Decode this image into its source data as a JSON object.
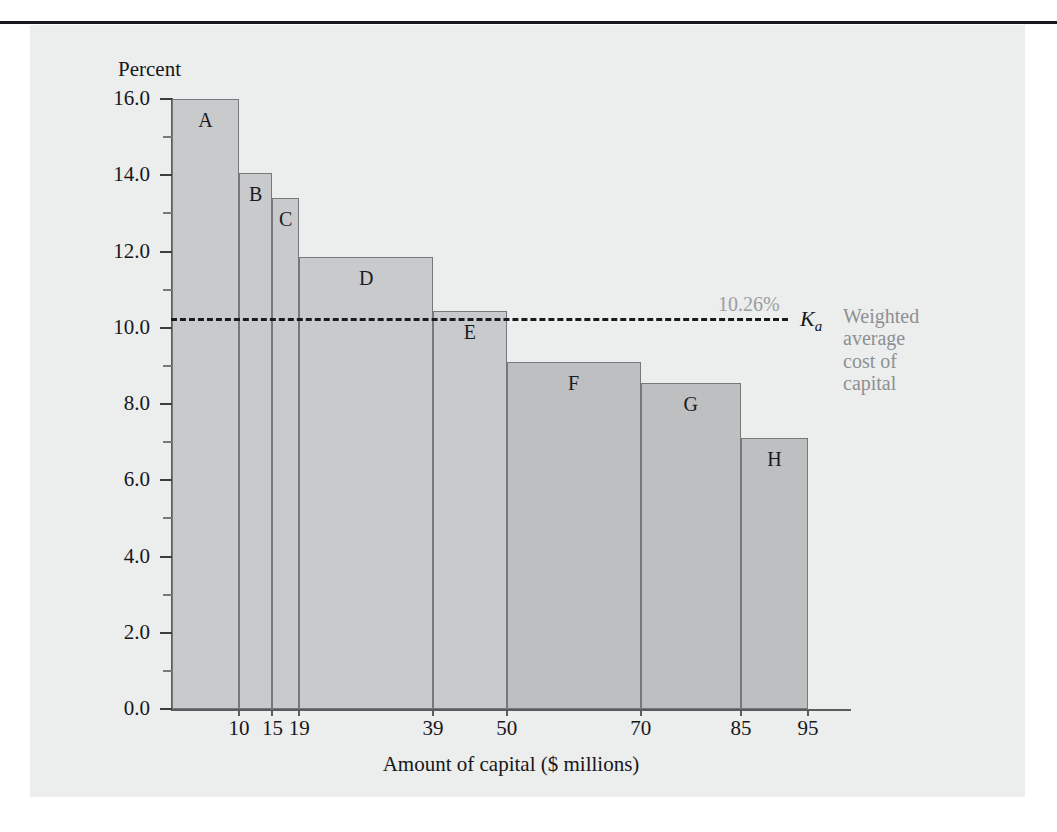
{
  "figure": {
    "y_axis_title": "Percent",
    "x_axis_title": "Amount of capital ($ millions)"
  },
  "annotation": {
    "wacc_value": "10.26%",
    "wacc_symbol": "K",
    "wacc_symbol_sub": "a",
    "caption_line1": "Weighted",
    "caption_line2": "average",
    "caption_line3": "cost of",
    "caption_line4": "capital"
  },
  "colors": {
    "panel_background": "#eceded",
    "bar_light": "#c9cacb",
    "bar_dark": "#bdbfc0",
    "bar_border": "#76797c",
    "text": "#16171a",
    "muted_text": "#8d9094",
    "top_rule": "#16171a"
  },
  "chart_data": {
    "type": "bar",
    "title": "",
    "xlabel": "Amount of capital ($ millions)",
    "ylabel": "Percent",
    "ylim": [
      0.0,
      16.0
    ],
    "xlim": [
      0,
      110
    ],
    "grid": false,
    "legend": "none",
    "y_ticks": [
      "0.0",
      "2.0",
      "4.0",
      "6.0",
      "8.0",
      "10.0",
      "12.0",
      "14.0",
      "16.0"
    ],
    "y_tick_values": [
      0.0,
      2.0,
      4.0,
      6.0,
      8.0,
      10.0,
      12.0,
      14.0,
      16.0
    ],
    "y_minor_tick_values": [
      1.0,
      3.0,
      5.0,
      7.0,
      9.0,
      11.0,
      13.0,
      15.0
    ],
    "x_ticks": [
      "10",
      "15",
      "19",
      "39",
      "50",
      "70",
      "85",
      "95"
    ],
    "x_tick_values": [
      10,
      15,
      19,
      39,
      50,
      70,
      85,
      95
    ],
    "bars": [
      {
        "label": "A",
        "x_start": 0,
        "x_end": 10,
        "value": 16.0,
        "shade": "light"
      },
      {
        "label": "B",
        "x_start": 10,
        "x_end": 15,
        "value": 14.05,
        "shade": "light"
      },
      {
        "label": "C",
        "x_start": 15,
        "x_end": 19,
        "value": 13.4,
        "shade": "light"
      },
      {
        "label": "D",
        "x_start": 19,
        "x_end": 39,
        "value": 11.85,
        "shade": "light"
      },
      {
        "label": "E",
        "x_start": 39,
        "x_end": 50,
        "value": 10.45,
        "shade": "light"
      },
      {
        "label": "F",
        "x_start": 50,
        "x_end": 70,
        "value": 9.1,
        "shade": "dark"
      },
      {
        "label": "G",
        "x_start": 70,
        "x_end": 85,
        "value": 8.55,
        "shade": "dark"
      },
      {
        "label": "H",
        "x_start": 85,
        "x_end": 95,
        "value": 7.1,
        "shade": "dark"
      }
    ],
    "reference_line": {
      "label": "10.26%",
      "value": 10.26,
      "style": "dashed",
      "symbol": "Ka"
    }
  }
}
